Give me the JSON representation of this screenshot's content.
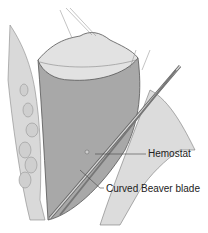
{
  "figure": {
    "labels": [
      {
        "id": "hemostat",
        "text": "Hemostat"
      },
      {
        "id": "blade",
        "text": "Curved Beaver blade"
      }
    ],
    "colors": {
      "tissue_light": "#e6e6e6",
      "tissue_mid": "#b8b8b8",
      "tissue_dark": "#7a7a7a",
      "outline": "#555555"
    }
  }
}
